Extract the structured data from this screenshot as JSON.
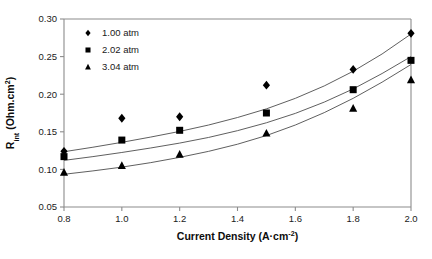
{
  "chart_data": {
    "type": "scatter",
    "title": "",
    "xlabel": "Current Density (A·cm",
    "xlabel_sup": "-2",
    "xlabel_tail": ")",
    "ylabel_main": "R",
    "ylabel_sub": "int",
    "ylabel_tail": " (Ohm.cm",
    "ylabel_sup": "2",
    "ylabel_tail2": ")",
    "xlim": [
      0.8,
      2.0
    ],
    "ylim": [
      0.05,
      0.3
    ],
    "xticks": [
      "0.8",
      "1.0",
      "1.2",
      "1.4",
      "1.6",
      "1.8",
      "2.0"
    ],
    "xtick_values": [
      0.8,
      1.0,
      1.2,
      1.4,
      1.6,
      1.8,
      2.0
    ],
    "yticks": [
      "0.05",
      "0.10",
      "0.15",
      "0.20",
      "0.25",
      "0.30"
    ],
    "ytick_values": [
      0.05,
      0.1,
      0.15,
      0.2,
      0.25,
      0.3
    ],
    "grid": false,
    "legend_position": "upper-left-inside",
    "x": [
      0.8,
      1.0,
      1.2,
      1.5,
      1.8,
      2.0
    ],
    "series": [
      {
        "name": "1.00 atm",
        "marker": "diamond",
        "color": "#000000",
        "values": [
          0.124,
          0.168,
          0.17,
          0.212,
          0.233,
          0.281
        ],
        "trendline": [
          [
            0.8,
            0.1235
          ],
          [
            0.9,
            0.1295
          ],
          [
            1.0,
            0.136
          ],
          [
            1.1,
            0.143
          ],
          [
            1.2,
            0.1505
          ],
          [
            1.3,
            0.159
          ],
          [
            1.4,
            0.169
          ],
          [
            1.5,
            0.1805
          ],
          [
            1.6,
            0.1945
          ],
          [
            1.7,
            0.211
          ],
          [
            1.8,
            0.2305
          ],
          [
            1.9,
            0.2535
          ],
          [
            2.0,
            0.28
          ]
        ]
      },
      {
        "name": "2.02 atm",
        "marker": "square",
        "color": "#000000",
        "values": [
          0.117,
          0.139,
          0.152,
          0.175,
          0.206,
          0.245
        ],
        "trendline": [
          [
            0.8,
            0.112
          ],
          [
            0.9,
            0.117
          ],
          [
            1.0,
            0.1225
          ],
          [
            1.1,
            0.1285
          ],
          [
            1.2,
            0.135
          ],
          [
            1.3,
            0.1425
          ],
          [
            1.4,
            0.1515
          ],
          [
            1.5,
            0.162
          ],
          [
            1.6,
            0.1745
          ],
          [
            1.7,
            0.1895
          ],
          [
            1.8,
            0.207
          ],
          [
            1.9,
            0.2275
          ],
          [
            2.0,
            0.25
          ]
        ]
      },
      {
        "name": "3.04 atm",
        "marker": "triangle",
        "color": "#000000",
        "values": [
          0.096,
          0.105,
          0.12,
          0.148,
          0.181,
          0.219
        ],
        "trendline": [
          [
            0.8,
            0.0935
          ],
          [
            0.9,
            0.098
          ],
          [
            1.0,
            0.103
          ],
          [
            1.1,
            0.109
          ],
          [
            1.2,
            0.116
          ],
          [
            1.3,
            0.124
          ],
          [
            1.4,
            0.1335
          ],
          [
            1.5,
            0.145
          ],
          [
            1.6,
            0.159
          ],
          [
            1.7,
            0.1755
          ],
          [
            1.8,
            0.1945
          ],
          [
            1.9,
            0.216
          ],
          [
            2.0,
            0.2395
          ]
        ]
      }
    ]
  }
}
